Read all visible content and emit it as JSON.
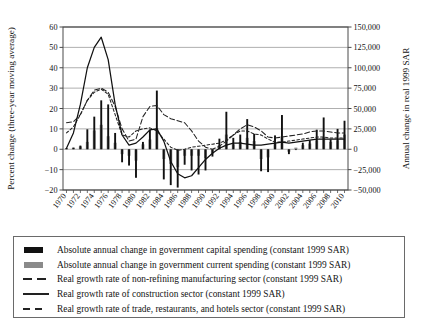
{
  "chart_data": {
    "type": "bar",
    "title": "",
    "xlabel": "",
    "ylabel": "Percent change (three-year moving average)",
    "y2label": "Annual change in real 1999 SAR",
    "ylim": [
      -20,
      60
    ],
    "y2lim": [
      -50000,
      150000
    ],
    "grid": true,
    "legend_position": "below",
    "y_ticks": [
      "60",
      "50",
      "40",
      "30",
      "20",
      "10",
      "0",
      "-10",
      "-20"
    ],
    "y_tick_values": [
      60,
      50,
      40,
      30,
      20,
      10,
      0,
      -10,
      -20
    ],
    "y2_ticks": [
      "150,000",
      "125,000",
      "100,000",
      "75,000",
      "50,000",
      "25,000",
      "0",
      "-25,000",
      "-50,000"
    ],
    "y2_tick_values": [
      150000,
      125000,
      100000,
      75000,
      50000,
      25000,
      0,
      -25000,
      -50000
    ],
    "x": [
      1970,
      1971,
      1972,
      1973,
      1974,
      1975,
      1976,
      1977,
      1978,
      1979,
      1980,
      1981,
      1982,
      1983,
      1984,
      1985,
      1986,
      1987,
      1988,
      1989,
      1990,
      1991,
      1992,
      1993,
      1994,
      1995,
      1996,
      1997,
      1998,
      1999,
      2000,
      2001,
      2002,
      2003,
      2004,
      2005,
      2006,
      2007,
      2008,
      2009,
      2010
    ],
    "x_tick_labels": [
      "1970",
      "1972",
      "1974",
      "1976",
      "1978",
      "1980",
      "1982",
      "1984",
      "1986",
      "1988",
      "1990",
      "1992",
      "1994",
      "1996",
      "1998",
      "2000",
      "2002",
      "2004",
      "2006",
      "2008",
      "2010"
    ],
    "series": [
      {
        "name": "Absolute annual change in government capital spending (constant 1999 SAR)",
        "type": "bar",
        "color": "#111111",
        "axis": "right",
        "unit": "SAR",
        "values": [
          1500,
          2000,
          4500,
          24500,
          40000,
          60000,
          55000,
          20000,
          -16000,
          -20000,
          -35000,
          9000,
          24000,
          72000,
          -37000,
          -44000,
          -47000,
          -19000,
          -26000,
          -31000,
          -26000,
          -9000,
          13000,
          46000,
          14000,
          18000,
          37000,
          19000,
          -27000,
          -28000,
          17000,
          42000,
          -6000,
          -1000,
          8000,
          11000,
          24000,
          39000,
          12000,
          25000,
          35000
        ]
      },
      {
        "name": "Absolute annual change in government current spending (constant 1999 SAR)",
        "type": "bar",
        "color": "#8a8a8a",
        "axis": "right",
        "unit": "SAR",
        "values": [
          1200,
          1800,
          3500,
          9000,
          23000,
          30000,
          16000,
          8000,
          -6000,
          -8000,
          -14000,
          6000,
          12000,
          26000,
          -12000,
          -18000,
          -22000,
          -8000,
          -8000,
          -8000,
          -11000,
          -5000,
          5000,
          18000,
          6000,
          9000,
          14000,
          10000,
          -12000,
          -10000,
          8000,
          16000,
          -3000,
          2000,
          5000,
          7000,
          11000,
          15000,
          9000,
          11000,
          18000
        ]
      },
      {
        "name": "Real growth rate of non-refining manufacturing sector (constant 1999 SAR)",
        "type": "line",
        "style": "dashed-long",
        "color": "#222222",
        "axis": "left",
        "unit": "percent",
        "values": [
          13.0,
          13.5,
          17.0,
          24.0,
          29.0,
          30.0,
          28.0,
          21.0,
          10.0,
          4.0,
          5.0,
          16.0,
          21.0,
          21.5,
          17.0,
          15.0,
          14.0,
          13.0,
          9.0,
          4.0,
          1.0,
          0.0,
          1.5,
          4.0,
          7.0,
          10.0,
          12.0,
          11.0,
          9.0,
          6.0,
          5.5,
          6.0,
          6.5,
          7.0,
          7.5,
          8.5,
          9.0,
          9.0,
          8.5,
          8.0,
          8.0
        ]
      },
      {
        "name": "Real growth rate of construction sector (constant 1999 SAR)",
        "type": "line",
        "style": "solid",
        "color": "#111111",
        "axis": "left",
        "unit": "percent",
        "values": [
          0.5,
          8.0,
          22.0,
          40.0,
          50.0,
          55.0,
          44.0,
          22.0,
          7.0,
          2.0,
          3.0,
          6.0,
          9.5,
          10.0,
          4.0,
          -6.0,
          -12.0,
          -14.0,
          -13.0,
          -9.0,
          -5.0,
          -2.0,
          0.5,
          2.0,
          3.0,
          3.0,
          2.5,
          2.0,
          2.0,
          2.5,
          3.0,
          3.5,
          3.0,
          3.5,
          4.0,
          4.5,
          5.0,
          5.0,
          5.0,
          5.0,
          5.0
        ]
      },
      {
        "name": "Real growth rate of trade, restaurants, and hotels sector (constant 1999 SAR)",
        "type": "line",
        "style": "dashed-short",
        "color": "#222222",
        "axis": "left",
        "unit": "percent",
        "values": [
          8.0,
          11.0,
          17.0,
          24.0,
          28.0,
          29.5,
          27.0,
          17.0,
          7.0,
          6.0,
          9.0,
          10.0,
          10.5,
          9.0,
          5.0,
          1.0,
          -0.5,
          0.0,
          1.0,
          1.5,
          2.0,
          2.5,
          3.0,
          4.5,
          7.0,
          9.0,
          9.0,
          7.5,
          7.0,
          5.0,
          3.5,
          3.5,
          4.0,
          4.5,
          5.0,
          5.5,
          6.0,
          6.0,
          5.5,
          5.5,
          5.5
        ]
      }
    ]
  },
  "legend": {
    "items": [
      {
        "key": "bar-black",
        "label": "Absolute annual change in government capital spending (constant 1999 SAR)"
      },
      {
        "key": "bar-gray",
        "label": "Absolute annual change in government current spending (constant 1999 SAR)"
      },
      {
        "key": "line-dashed-long",
        "label": "Real growth rate of non-refining manufacturing sector (constant 1999 SAR)"
      },
      {
        "key": "line-solid",
        "label": "Real growth rate of construction sector (constant 1999 SAR)"
      },
      {
        "key": "line-dashed-short",
        "label": "Real growth rate of trade, restaurants, and hotels sector (constant 1999 SAR)"
      }
    ]
  },
  "colors": {
    "capital_bar": "#111111",
    "current_bar": "#8a8a8a",
    "axis": "#4a4a4a",
    "grid": "#9a9a9a"
  }
}
